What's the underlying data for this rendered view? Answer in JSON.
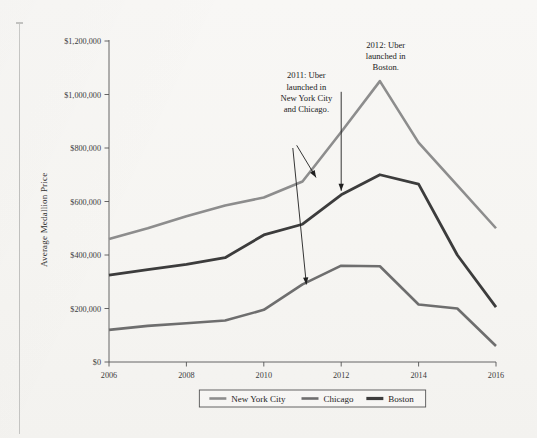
{
  "figure": {
    "background_color": "#f7f6f4",
    "margin_rule_color": "#c4c4c2"
  },
  "chart_data": {
    "type": "line",
    "title": "",
    "xlabel": "",
    "ylabel": "Average Medallion Price",
    "x": [
      2006,
      2007,
      2008,
      2009,
      2010,
      2011,
      2012,
      2013,
      2014,
      2015,
      2016
    ],
    "xlim": [
      2006,
      2016
    ],
    "ylim": [
      0,
      1200000
    ],
    "xticks": [
      2006,
      2008,
      2010,
      2012,
      2014,
      2016
    ],
    "xtick_labels": [
      "2006",
      "2008",
      "2010",
      "2012",
      "2014",
      "2016"
    ],
    "yticks": [
      0,
      200000,
      400000,
      600000,
      800000,
      1000000,
      1200000
    ],
    "ytick_labels": [
      "$0",
      "$200,000",
      "$400,000",
      "$600,000",
      "$800,000",
      "$1,000,000",
      "$1,200,000"
    ],
    "grid": false,
    "legend_position": "below-axis-center",
    "series": [
      {
        "name": "New York City",
        "color": "#8d8d8d",
        "width": 2.6,
        "values": [
          460000,
          500000,
          545000,
          585000,
          615000,
          675000,
          860000,
          1050000,
          820000,
          660000,
          500000
        ]
      },
      {
        "name": "Chicago",
        "color": "#6e6e6e",
        "width": 2.6,
        "values": [
          120000,
          135000,
          145000,
          155000,
          195000,
          290000,
          360000,
          358000,
          215000,
          200000,
          60000
        ]
      },
      {
        "name": "Boston",
        "color": "#3c3c3c",
        "width": 2.8,
        "values": [
          325000,
          345000,
          365000,
          390000,
          475000,
          515000,
          625000,
          700000,
          665000,
          400000,
          205000
        ]
      }
    ],
    "annotations": [
      {
        "id": "annotation-2011",
        "text_lines": [
          "2011: Uber",
          "launched in",
          "New York City",
          "and Chicago."
        ],
        "text_x": 2011.1,
        "text_y_top": 1060000,
        "arrows": [
          {
            "from_x": 2010.85,
            "from_y": 810000,
            "to_x": 2011.35,
            "to_y": 690000
          },
          {
            "from_x": 2010.75,
            "from_y": 800000,
            "to_x": 2011.1,
            "to_y": 290000
          }
        ]
      },
      {
        "id": "annotation-2012",
        "text_lines": [
          "2012: Uber",
          "launched in",
          "Boston."
        ],
        "text_x": 2013.15,
        "text_y_top": 1175000,
        "arrows": [
          {
            "from_x": 2012.0,
            "from_y": 1010000,
            "to_x": 2012.0,
            "to_y": 640000
          }
        ]
      }
    ]
  },
  "legend": {
    "items": [
      {
        "label": "New York City",
        "color": "#8d8d8d"
      },
      {
        "label": "Chicago",
        "color": "#6e6e6e"
      },
      {
        "label": "Boston",
        "color": "#3c3c3c"
      }
    ]
  }
}
